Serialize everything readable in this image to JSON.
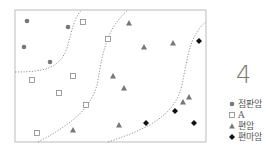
{
  "figure": {
    "panel_number": "4",
    "plot_frame": {
      "x": 15,
      "y": 10,
      "width": 191,
      "height": 132
    },
    "boundary_style": "dotted",
    "colors": {
      "frame": "#bbbbbb",
      "boundary": "#888888",
      "circle": "#777777",
      "square_stroke": "#888888",
      "triangle": "#777777",
      "diamond": "#111111"
    }
  },
  "legend": {
    "items": [
      {
        "marker": "circle",
        "label": "점판암"
      },
      {
        "marker": "square",
        "label": "A"
      },
      {
        "marker": "triangle",
        "label": "편암"
      },
      {
        "marker": "diamond",
        "label": "편마암"
      }
    ]
  },
  "chart_data": {
    "type": "scatter",
    "title": "",
    "xlabel": "",
    "ylabel": "",
    "grid": false,
    "legend_position": "right",
    "annotations": [
      "4"
    ],
    "series": [
      {
        "name": "점판암",
        "marker": "circle",
        "points": [
          [
            27,
            21
          ],
          [
            68,
            27
          ],
          [
            24,
            47
          ],
          [
            50,
            62
          ]
        ]
      },
      {
        "name": "A",
        "marker": "square",
        "points": [
          [
            83,
            22
          ],
          [
            108,
            39
          ],
          [
            73,
            76
          ],
          [
            32,
            80
          ],
          [
            59,
            93
          ],
          [
            86,
            105
          ],
          [
            37,
            133
          ]
        ]
      },
      {
        "name": "편암",
        "marker": "triangle",
        "points": [
          [
            129,
            23
          ],
          [
            144,
            47
          ],
          [
            173,
            43
          ],
          [
            113,
            76
          ],
          [
            124,
            88
          ],
          [
            183,
            102
          ],
          [
            189,
            97
          ],
          [
            73,
            130
          ],
          [
            119,
            125
          ]
        ]
      },
      {
        "name": "편마암",
        "marker": "diamond",
        "points": [
          [
            199,
            41
          ],
          [
            175,
            111
          ],
          [
            146,
            123
          ],
          [
            194,
            123
          ]
        ]
      }
    ],
    "boundaries": [
      {
        "separates": [
          "점판암",
          "A"
        ],
        "path": "M15,72 C45,72 60,68 67,48 C72,30 75,15 82,10"
      },
      {
        "separates": [
          "A",
          "편암"
        ],
        "path": "M38,142 C70,125 90,110 97,85 C102,60 104,30 128,10"
      },
      {
        "separates": [
          "편암",
          "편마암"
        ],
        "path": "M108,142 C150,128 175,115 182,85 C188,55 190,35 206,22"
      }
    ]
  }
}
